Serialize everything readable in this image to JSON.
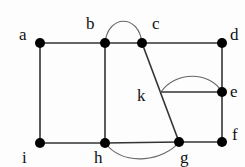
{
  "diagram": {
    "type": "graph",
    "nodes": [
      {
        "id": "a",
        "label": "a",
        "x": 40,
        "y": 43,
        "lx": 19,
        "ly": 40,
        "dot": true
      },
      {
        "id": "b",
        "label": "b",
        "x": 105,
        "y": 43,
        "lx": 86,
        "ly": 29,
        "dot": true
      },
      {
        "id": "c",
        "label": "c",
        "x": 142,
        "y": 43,
        "lx": 152,
        "ly": 29,
        "dot": true
      },
      {
        "id": "d",
        "label": "d",
        "x": 222,
        "y": 43,
        "lx": 230,
        "ly": 40,
        "dot": true
      },
      {
        "id": "e",
        "label": "e",
        "x": 222,
        "y": 92,
        "lx": 230,
        "ly": 97,
        "dot": true
      },
      {
        "id": "f",
        "label": "f",
        "x": 222,
        "y": 142,
        "lx": 232,
        "ly": 140,
        "dot": true
      },
      {
        "id": "g",
        "label": "g",
        "x": 179,
        "y": 142,
        "lx": 180,
        "ly": 163,
        "dot": true
      },
      {
        "id": "h",
        "label": "h",
        "x": 105,
        "y": 143,
        "lx": 94,
        "ly": 163,
        "dot": true
      },
      {
        "id": "i",
        "label": "i",
        "x": 40,
        "y": 143,
        "lx": 22,
        "ly": 163,
        "dot": true
      },
      {
        "id": "k",
        "label": "k",
        "x": 161,
        "y": 92,
        "lx": 137,
        "ly": 101,
        "dot": false
      }
    ],
    "edges": [
      {
        "from": "a",
        "to": "b"
      },
      {
        "from": "b",
        "to": "c"
      },
      {
        "from": "c",
        "to": "d"
      },
      {
        "from": "a",
        "to": "i"
      },
      {
        "from": "b",
        "to": "h"
      },
      {
        "from": "d",
        "to": "e"
      },
      {
        "from": "e",
        "to": "f"
      },
      {
        "from": "i",
        "to": "h"
      },
      {
        "from": "h",
        "to": "g"
      },
      {
        "from": "g",
        "to": "f"
      },
      {
        "from": "c",
        "to": "g"
      },
      {
        "from": "k",
        "to": "e"
      }
    ],
    "curved_edges": [
      {
        "from": "b",
        "to": "c",
        "path": "M105,43 C108,14 139,14 142,43"
      },
      {
        "from": "k",
        "to": "e",
        "path": "M161,92 C175,71 210,71 222,92"
      },
      {
        "from": "h",
        "to": "g",
        "path": "M105,143 C125,168 165,160 179,142"
      }
    ],
    "colors": {
      "edge": "#333333",
      "curve": "#666666",
      "node": "#000000"
    }
  }
}
